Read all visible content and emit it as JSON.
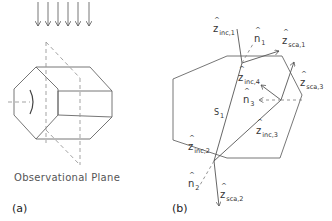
{
  "panel_a": {
    "label": "(a)",
    "plane_label": "Observational Plane"
  },
  "panel_b": {
    "label": "(b)",
    "vectors": {
      "z_inc_1": {
        "sym": "z",
        "sub": "inc,1"
      },
      "n_1": {
        "sym": "n",
        "sub": "1"
      },
      "z_sca_1": {
        "sym": "z",
        "sub": "sca,1"
      },
      "z_inc_4": {
        "sym": "z",
        "sub": "inc,4"
      },
      "z_sca_3": {
        "sym": "z",
        "sub": "sca,3"
      },
      "n_3": {
        "sym": "n",
        "sub": "3"
      },
      "s_1": {
        "sym": "S",
        "sub": "1"
      },
      "z_inc_3": {
        "sym": "z",
        "sub": "inc,3"
      },
      "z_inc_2": {
        "sym": "z",
        "sub": "inc,2"
      },
      "n_2": {
        "sym": "n",
        "sub": "2"
      },
      "z_sca_2": {
        "sym": "z",
        "sub": "sca,2"
      }
    }
  },
  "colors": {
    "line": "#555555",
    "dash": "#888888",
    "text": "#333333"
  }
}
